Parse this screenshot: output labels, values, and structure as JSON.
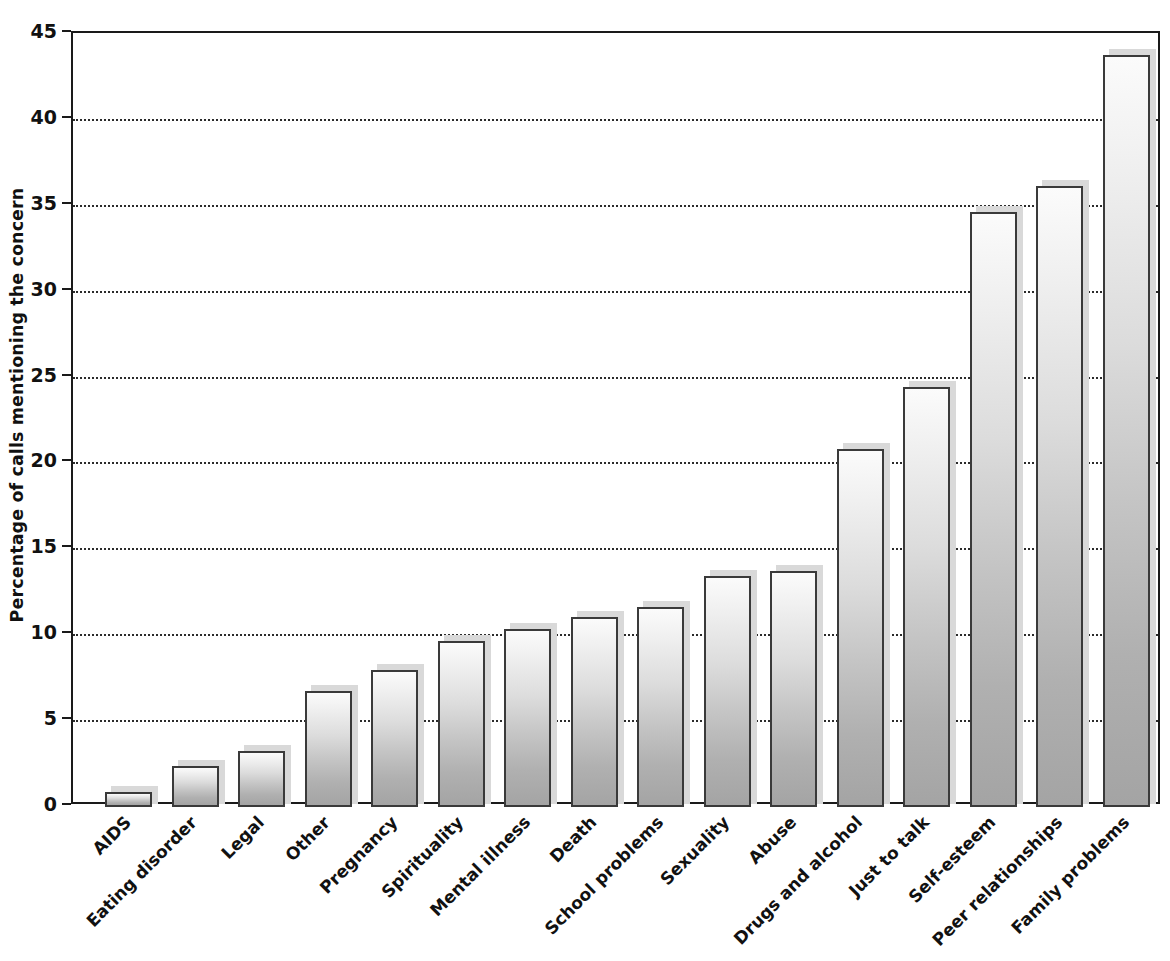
{
  "chart_data": {
    "type": "bar",
    "title": "",
    "subtitle": "",
    "xlabel": "",
    "ylabel": "Percentage of calls mentioning the concern",
    "ylim": [
      0,
      45
    ],
    "ytick_step": 5,
    "yticks": [
      "45",
      "40",
      "35",
      "30",
      "25",
      "20",
      "15",
      "10",
      "5",
      "0"
    ],
    "ytick_values": [
      45,
      40,
      35,
      30,
      25,
      20,
      15,
      10,
      5,
      0
    ],
    "grid": true,
    "grid_axis": "y",
    "grid_style": "dotted",
    "legend": "none",
    "orientation": "vertical",
    "sorted": "ascending",
    "categories": [
      "AIDS",
      "Eating disorder",
      "Legal",
      "Other",
      "Pregnancy",
      "Spirituality",
      "Mental illness",
      "Death",
      "School problems",
      "Sexuality",
      "Abuse",
      "Drugs and alcohol",
      "Just to talk",
      "Self-esteem",
      "Peer relationships",
      "Family problems"
    ],
    "values": [
      0.8,
      2.3,
      3.2,
      6.7,
      7.9,
      9.6,
      10.3,
      11.0,
      11.6,
      13.4,
      13.7,
      20.8,
      24.4,
      34.6,
      36.1,
      43.7
    ],
    "bar_style": {
      "fill": "vertical-gradient",
      "fill_top": "#fbfbfb",
      "fill_bottom": "#a4a4a4",
      "border": "#3a3a3a",
      "shadow": "#d9d9d9"
    },
    "axis_color": "#1a1a1a",
    "background": "#ffffff"
  }
}
